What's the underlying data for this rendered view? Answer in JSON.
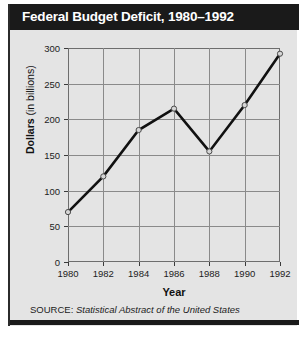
{
  "figure": {
    "title": "Federal Budget Deficit, 1980–1992",
    "source_label": "SOURCE:",
    "source_title": "Statistical Abstract of the United States",
    "title_bar_color": "#1a1a1a",
    "panel_color": "#e4e4e4",
    "line_color": "#111111",
    "grid_color": "#8a8a8a",
    "marker_fill": "#d6d6d6"
  },
  "chart_data": {
    "type": "line",
    "title": "Federal Budget Deficit, 1980–1992",
    "xlabel": "Year",
    "ylabel_bold": "Dollars",
    "ylabel_rest": " (in billions)",
    "ylabel": "Dollars (in billions)",
    "x": [
      1980,
      1982,
      1984,
      1986,
      1988,
      1990,
      1992
    ],
    "values": [
      70,
      120,
      185,
      215,
      155,
      220,
      292
    ],
    "xtick_labels": [
      "1980",
      "1982",
      "1984",
      "1986",
      "1988",
      "1990",
      "1992"
    ],
    "ytick_labels": [
      "0",
      "50",
      "100",
      "150",
      "200",
      "250",
      "300"
    ],
    "yticks": [
      0,
      50,
      100,
      150,
      200,
      250,
      300
    ],
    "xlim": [
      1980,
      1992
    ],
    "ylim": [
      0,
      300
    ],
    "grid": true,
    "legend": "none",
    "markers": "open-circle"
  }
}
